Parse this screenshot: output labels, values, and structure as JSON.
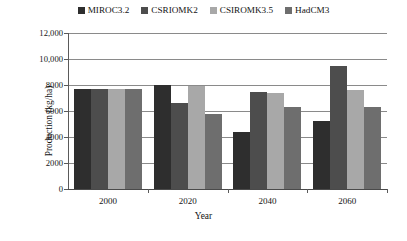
{
  "chart_data": {
    "type": "bar",
    "title": "",
    "xlabel": "Year",
    "ylabel": "Production (kg/ha)",
    "categories": [
      "2000",
      "2020",
      "2040",
      "2060"
    ],
    "ylim": [
      0,
      12000
    ],
    "ytick_labels": [
      "0",
      "2000",
      "4000",
      "6000",
      "8000",
      "10,000",
      "12,000"
    ],
    "ytick_values": [
      0,
      2000,
      4000,
      6000,
      8000,
      10000,
      12000
    ],
    "grid": true,
    "legend_position": "top-center",
    "series": [
      {
        "name": "MIROC3.2",
        "color": "#2e2e2e",
        "values": [
          7700,
          8000,
          4400,
          5200
        ]
      },
      {
        "name": "CSRIOMK2",
        "color": "#4d4d4d",
        "values": [
          7700,
          6600,
          7500,
          9500
        ]
      },
      {
        "name": "CSIROMK3.5",
        "color": "#a8a8a8",
        "values": [
          7700,
          7900,
          7400,
          7600
        ]
      },
      {
        "name": "HadCM3",
        "color": "#6e6e6e",
        "values": [
          7700,
          5800,
          6300,
          6300
        ]
      }
    ]
  }
}
